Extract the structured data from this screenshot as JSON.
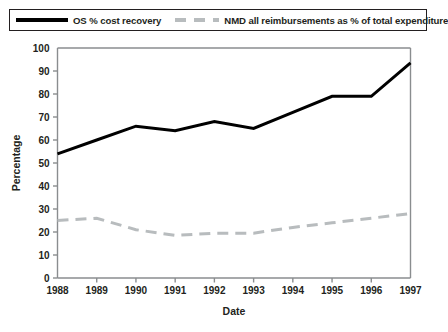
{
  "legend": {
    "items": [
      {
        "label": "OS % cost recovery",
        "style": "solid",
        "color": "#000000",
        "key": "os_cost_recovery"
      },
      {
        "label": "NMD all reimbursements as % of total expenditure",
        "style": "dashed",
        "color": "#b8bcbe",
        "key": "nmd_reimbursements"
      }
    ]
  },
  "chart_data": {
    "type": "line",
    "title": "",
    "xlabel": "Date",
    "ylabel": "Percentage",
    "x": [
      "1988",
      "1989",
      "1990",
      "1991",
      "1992",
      "1993",
      "1994",
      "1995",
      "1996",
      "1997"
    ],
    "xlim": [
      1988,
      1997
    ],
    "ylim": [
      0,
      100
    ],
    "ytick_values": [
      0,
      10,
      20,
      30,
      40,
      50,
      60,
      70,
      80,
      90,
      100
    ],
    "ytick_labels": [
      "0",
      "10",
      "20",
      "30",
      "40",
      "50",
      "60",
      "70",
      "80",
      "90",
      "100"
    ],
    "xtick_labels": [
      "1988",
      "1989",
      "1990",
      "1991",
      "1992",
      "1993",
      "1994",
      "1995",
      "1996",
      "1997"
    ],
    "grid": false,
    "legend_position": "top",
    "series": [
      {
        "name": "OS % cost recovery",
        "color": "#000000",
        "style": "solid",
        "values": [
          54,
          60,
          66,
          64,
          68,
          65,
          72,
          79,
          79,
          93.5
        ]
      },
      {
        "name": "NMD all reimbursements as % of total expenditure",
        "color": "#b8bcbe",
        "style": "dashed",
        "values": [
          25,
          26,
          21,
          18.5,
          19.5,
          19.5,
          22,
          24,
          26,
          28
        ]
      }
    ]
  }
}
